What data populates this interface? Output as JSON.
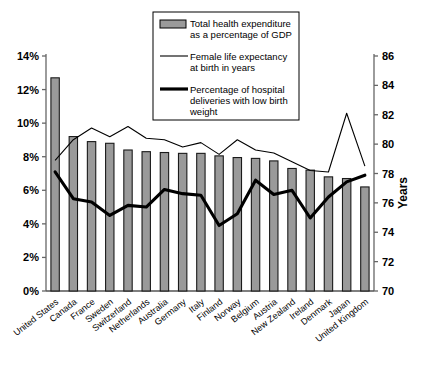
{
  "chart_data": {
    "type": "bar",
    "title": "",
    "xlabel": "",
    "ylabel": "",
    "y2label": "Years",
    "grid": false,
    "legend_position": "top-center",
    "ylim": [
      0,
      14
    ],
    "y2lim": [
      70,
      86
    ],
    "yticks": [
      "0%",
      "2%",
      "4%",
      "6%",
      "8%",
      "10%",
      "12%",
      "14%"
    ],
    "y2ticks": [
      "70",
      "72",
      "74",
      "76",
      "78",
      "80",
      "82",
      "84",
      "86"
    ],
    "categories": [
      "United States",
      "Canada",
      "France",
      "Sweden",
      "Switzerland",
      "Netherlands",
      "Australia",
      "Germany",
      "Italy",
      "Finland",
      "Norway",
      "Belgium",
      "Austria",
      "New Zealand",
      "Ireland",
      "Denmark",
      "Japan",
      "United Kingdom"
    ],
    "series": [
      {
        "name": "Total health expenditure as a percentage of GDP",
        "type": "bar",
        "axis": "left",
        "unit": "%",
        "values": [
          12.7,
          9.2,
          8.9,
          8.8,
          8.4,
          8.3,
          8.25,
          8.2,
          8.2,
          8.05,
          7.95,
          7.9,
          7.75,
          7.3,
          7.2,
          6.8,
          6.7,
          6.2
        ]
      },
      {
        "name": "Female life expectancy at birth in years",
        "type": "line",
        "axis": "right",
        "unit": "years",
        "values": [
          78.9,
          80.3,
          81.1,
          80.5,
          81.2,
          80.4,
          80.3,
          79.8,
          80.1,
          79.3,
          80.3,
          79.6,
          79.4,
          78.8,
          78.2,
          78.1,
          82.1,
          78.5
        ]
      },
      {
        "name": "Percentage of hospital deliveries with low birth weight",
        "type": "line",
        "axis": "left",
        "unit": "%",
        "values": [
          7.1,
          5.5,
          5.3,
          4.5,
          5.1,
          5.0,
          6.05,
          5.8,
          5.7,
          3.9,
          4.6,
          6.6,
          5.75,
          6.0,
          4.35,
          5.6,
          6.5,
          6.9
        ]
      }
    ],
    "legend": [
      {
        "label_lines": [
          "Total health expenditure",
          "as a percentage of GDP"
        ],
        "marker": "bar-swatch"
      },
      {
        "label_lines": [
          "Female life expectancy",
          "at birth in years"
        ],
        "marker": "thin-line"
      },
      {
        "label_lines": [
          "Percentage of hospital",
          "deliveries with low birth",
          "weight"
        ],
        "marker": "thick-line"
      }
    ],
    "colors": {
      "bar_fill": "#9a9a9a",
      "bar_stroke": "#1a1a1a",
      "thin_line": "#000000",
      "thick_line": "#000000",
      "axis": "#666666",
      "background": "#ffffff"
    }
  }
}
